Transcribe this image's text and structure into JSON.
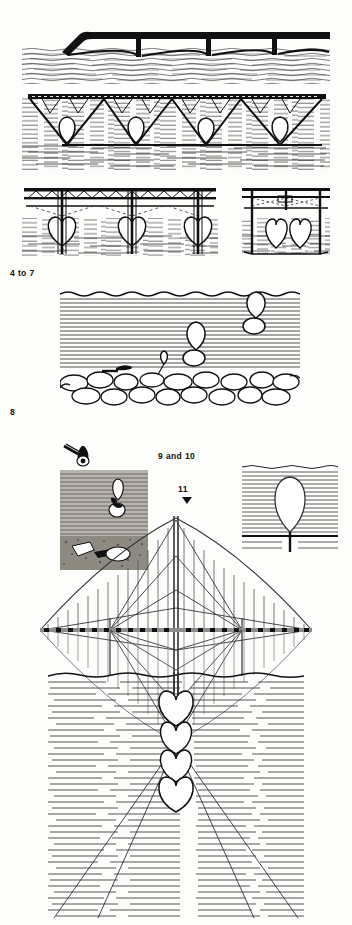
{
  "figure": {
    "background_color": "#fdfdfc",
    "ink_color": "#111111",
    "width": 352,
    "height": 925
  },
  "captions": [
    {
      "id": "caption-4-to-7",
      "text": "4 to 7",
      "x": 10,
      "y": 268
    },
    {
      "id": "caption-8",
      "text": "8",
      "x": 10,
      "y": 407
    },
    {
      "id": "caption-9-10",
      "text": "9 and 10",
      "x": 158,
      "y": 451
    },
    {
      "id": "caption-11",
      "text": "11",
      "x": 178,
      "y": 484
    }
  ],
  "marker": {
    "name": "down-triangle-marker",
    "x": 182,
    "y": 496
  },
  "panels": [
    {
      "id": "panel-arch-viaduct",
      "label": "low arch viaduct over water",
      "x": 22,
      "y": 22,
      "w": 308,
      "h": 62,
      "piers": 3,
      "spans": 4
    },
    {
      "id": "panel-truss-bridge-moorings",
      "label": "truss bridge with four teardrop moorings",
      "x": 22,
      "y": 88,
      "w": 308,
      "h": 80,
      "teardrops": 4,
      "truss_bays": 8
    },
    {
      "id": "panel-trestle-left",
      "label": "trestle bridge with three heart-shaped moorings",
      "x": 22,
      "y": 184,
      "w": 196,
      "h": 70,
      "teardrops": 3
    },
    {
      "id": "panel-trestle-right",
      "label": "scaffold frame with two teardrop moorings",
      "x": 240,
      "y": 184,
      "w": 90,
      "h": 70,
      "teardrops": 2
    },
    {
      "id": "panel-seabed-section",
      "label": "water column section with cobble seabed and rising moorings",
      "x": 60,
      "y": 290,
      "w": 240,
      "h": 115,
      "teardrops": 2
    },
    {
      "id": "panel-inset-photo",
      "label": "dark inset plate with mooring and seabed debris",
      "x": 60,
      "y": 470,
      "w": 88,
      "h": 98
    },
    {
      "id": "panel-inset-teardrop",
      "label": "single teardrop mooring on ruled water",
      "x": 242,
      "y": 462,
      "w": 95,
      "h": 95
    },
    {
      "id": "panel-suspension-bridge",
      "label": "suspension bridge elevation with mirrored reflection",
      "x": 40,
      "y": 500,
      "w": 272,
      "h": 190,
      "towers": 1,
      "side_piers": 2
    },
    {
      "id": "panel-underwater",
      "label": "underwater view with four stacked heart moorings and cable rays",
      "x": 48,
      "y": 672,
      "w": 256,
      "h": 245,
      "teardrops": 4
    }
  ]
}
